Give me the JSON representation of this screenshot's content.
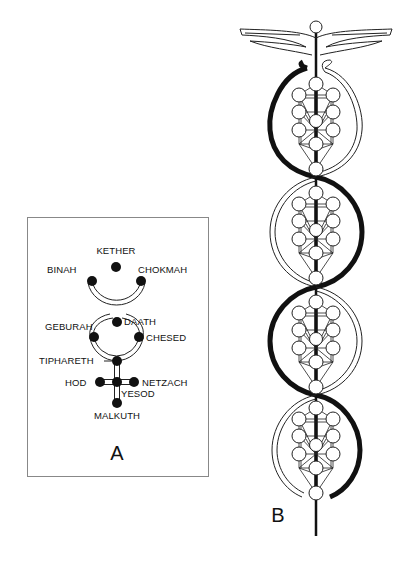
{
  "figure": {
    "panel_a": {
      "caption": "A",
      "sephiroth": [
        {
          "name": "KETHER",
          "x": 116,
          "y": 267,
          "label_x": 116,
          "label_y": 254,
          "anchor": "middle"
        },
        {
          "name": "BINAH",
          "x": 92,
          "y": 281,
          "label_x": 47,
          "label_y": 273,
          "anchor": "start"
        },
        {
          "name": "CHOKMAH",
          "x": 141,
          "y": 281,
          "label_x": 138,
          "label_y": 273,
          "anchor": "start"
        },
        {
          "name": "DAATH",
          "x": 117,
          "y": 322,
          "label_x": 124,
          "label_y": 325,
          "anchor": "start"
        },
        {
          "name": "GEBURAH",
          "x": 94,
          "y": 337,
          "label_x": 45,
          "label_y": 330,
          "anchor": "start"
        },
        {
          "name": "CHESED",
          "x": 139,
          "y": 337,
          "label_x": 146,
          "label_y": 341,
          "anchor": "start"
        },
        {
          "name": "TIPHARETH",
          "x": 117,
          "y": 361,
          "label_x": 39,
          "label_y": 364,
          "anchor": "start"
        },
        {
          "name": "HOD",
          "x": 100,
          "y": 382,
          "label_x": 65,
          "label_y": 386,
          "anchor": "start"
        },
        {
          "name": "NETZACH",
          "x": 134,
          "y": 382,
          "label_x": 142,
          "label_y": 386,
          "anchor": "start"
        },
        {
          "name": "YESOD",
          "x": 117,
          "y": 382,
          "label_x": 121,
          "label_y": 397,
          "anchor": "start"
        },
        {
          "name": "MALKUTH",
          "x": 117,
          "y": 403,
          "label_x": 117,
          "label_y": 419,
          "anchor": "middle"
        }
      ]
    },
    "panel_b": {
      "caption": "B",
      "description": "Caduceus with winged top; staff passes through four oval serpent loops each enclosing a Tree of Life"
    }
  }
}
